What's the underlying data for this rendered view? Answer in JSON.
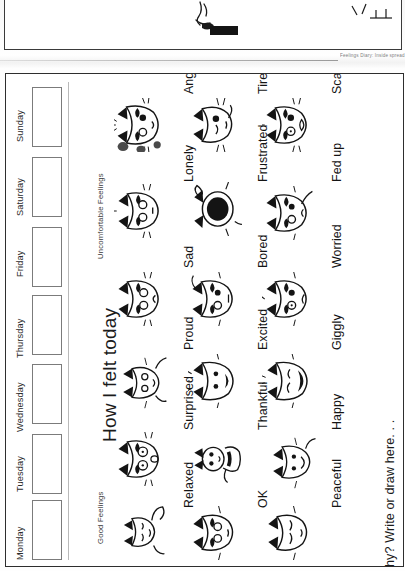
{
  "document": {
    "caption": "Feelings Diary: Inside spread",
    "page_title": "How I felt today",
    "prompt": "Why? Write or draw here. . ."
  },
  "days": {
    "heading": "Days of the week",
    "items": [
      {
        "label": "Sunday",
        "value": ""
      },
      {
        "label": "Saturday",
        "value": ""
      },
      {
        "label": "Friday",
        "value": ""
      },
      {
        "label": "Thursday",
        "value": ""
      },
      {
        "label": "Wednesday",
        "value": ""
      },
      {
        "label": "Tuesday",
        "value": ""
      },
      {
        "label": "Monday",
        "value": ""
      }
    ]
  },
  "groups": [
    {
      "id": "uncomfortable",
      "label": "Uncomfortable Feelings"
    },
    {
      "id": "good",
      "label": "Good Feelings"
    }
  ],
  "feelings": {
    "columns": [
      {
        "id": "column-1",
        "items": [
          {
            "label": "Angry",
            "group": "uncomfortable",
            "icon": "angry-cat-icon"
          },
          {
            "label": "Lonely",
            "group": "uncomfortable",
            "icon": "lonely-cat-icon"
          },
          {
            "label": "Sad",
            "group": "uncomfortable",
            "icon": "sad-cat-icon"
          },
          {
            "label": "Proud",
            "group": "good",
            "icon": "proud-cat-icon"
          },
          {
            "label": "Surprised",
            "group": "good",
            "icon": "surprised-cat-icon"
          },
          {
            "label": "Relaxed",
            "group": "good",
            "icon": "relaxed-cat-icon"
          }
        ]
      },
      {
        "id": "column-2",
        "items": [
          {
            "label": "Tired",
            "group": "uncomfortable",
            "icon": "tired-cat-icon"
          },
          {
            "label": "Frustrated",
            "group": "uncomfortable",
            "icon": "frustrated-cat-icon"
          },
          {
            "label": "Bored",
            "group": "uncomfortable",
            "icon": "bored-cat-icon"
          },
          {
            "label": "Excited",
            "group": "good",
            "icon": "excited-cat-icon"
          },
          {
            "label": "Thankful",
            "group": "good",
            "icon": "thankful-cat-icon"
          },
          {
            "label": "OK",
            "group": "good",
            "icon": "ok-cat-icon"
          }
        ]
      },
      {
        "id": "column-3",
        "items": [
          {
            "label": "Scared",
            "group": "uncomfortable",
            "icon": "scared-cat-icon"
          },
          {
            "label": "Fed up",
            "group": "uncomfortable",
            "icon": "fedup-cat-icon"
          },
          {
            "label": "Worried",
            "group": "uncomfortable",
            "icon": "worried-cat-icon"
          },
          {
            "label": "Giggly",
            "group": "good",
            "icon": "giggly-cat-icon"
          },
          {
            "label": "Happy",
            "group": "good",
            "icon": "happy-cat-icon"
          },
          {
            "label": "Peaceful",
            "group": "good",
            "icon": "peaceful-cat-icon"
          }
        ]
      }
    ]
  },
  "colors": {
    "ink": "#1a1a1a",
    "frame": "#2e2e2e",
    "box_border": "#7b7b7b",
    "caption": "#7d7d7d",
    "paper": "#ffffff"
  }
}
